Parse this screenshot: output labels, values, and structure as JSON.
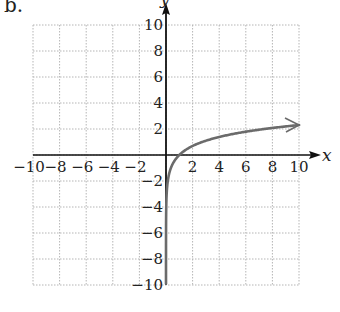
{
  "panel_label": "b.",
  "chart_data": {
    "type": "line",
    "title": "",
    "xlabel": "x",
    "ylabel": "y",
    "xlim": [
      -10,
      10
    ],
    "ylim": [
      -10,
      10
    ],
    "grid": true,
    "grid_step": 2,
    "x_ticks": [
      -10,
      -8,
      -6,
      -4,
      -2,
      2,
      4,
      6,
      8,
      10
    ],
    "y_ticks": [
      -10,
      -8,
      -6,
      -4,
      -2,
      2,
      4,
      6,
      8,
      10
    ],
    "series": [
      {
        "name": "y = ln(x)",
        "function": "ln(x)",
        "color": "#6b6b6b",
        "domain": [
          5e-05,
          10
        ],
        "end_arrow": true,
        "x": [
          0.0001,
          0.001,
          0.01,
          0.1,
          0.25,
          0.5,
          1,
          2,
          3,
          4,
          5,
          6,
          7,
          8,
          9,
          10
        ],
        "y": [
          -9.21,
          -6.91,
          -4.61,
          -2.3,
          -1.39,
          -0.69,
          0,
          0.69,
          1.1,
          1.39,
          1.61,
          1.79,
          1.95,
          2.08,
          2.2,
          2.3
        ]
      }
    ]
  },
  "colors": {
    "axis": "#111111",
    "grid": "#b5b5b5",
    "curve": "#6b6b6b",
    "text": "#222222"
  }
}
